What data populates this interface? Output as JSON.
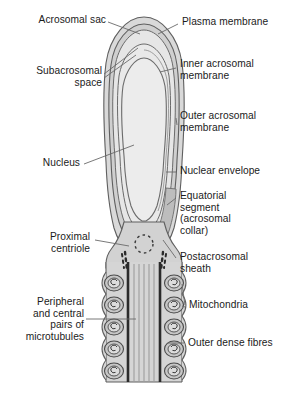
{
  "figure": {
    "type": "labelled-anatomical-diagram",
    "background_color": "#ffffff",
    "line_color": "#555555",
    "leader_color": "#6a6a6a"
  },
  "labels": {
    "acrosomal_sac": "Acrosomal sac",
    "plasma_membrane": "Plasma membrane",
    "subacrosomal_space": "Subacrosomal\nspace",
    "inner_acrosomal_membrane": "Inner acrosomal\nmembrane",
    "outer_acrosomal_membrane": "Outer acrosomal\nmembrane",
    "nucleus": "Nucleus",
    "nuclear_envelope": "Nuclear envelope",
    "equatorial_segment": "Equatorial\nsegment\n(acrosomal\ncollar)",
    "proximal_centriole": "Proximal\ncentriole",
    "postacrosomal_sheath": "Postacrosomal\nsheath",
    "mitochondria": "Mitochondria",
    "microtubules": "Peripheral\nand central\npairs of\nmicrotubules",
    "outer_dense_fibres": "Outer dense fibres"
  },
  "colors": {
    "nucleus_fill": "#eaeaea",
    "cytoplasm_fill": "#d8d8d8",
    "acrosome_fill": "#cfcfcf",
    "sheath_fill": "#c4c4c4",
    "membrane_stroke": "#6b6b6b",
    "dense_fibre": "#2b2b2b",
    "microtubule": "#9a9a9a",
    "mitochondria_stroke": "#4a4a4a",
    "mitochondria_fill": "#bdbdbd",
    "text": "#1b1b1b"
  },
  "structures": {
    "mitochondria_count_left": 5,
    "mitochondria_count_right": 5,
    "centriole_dot_count": 9,
    "dense_fibre_lines": 2,
    "microtubule_lines": 5
  }
}
